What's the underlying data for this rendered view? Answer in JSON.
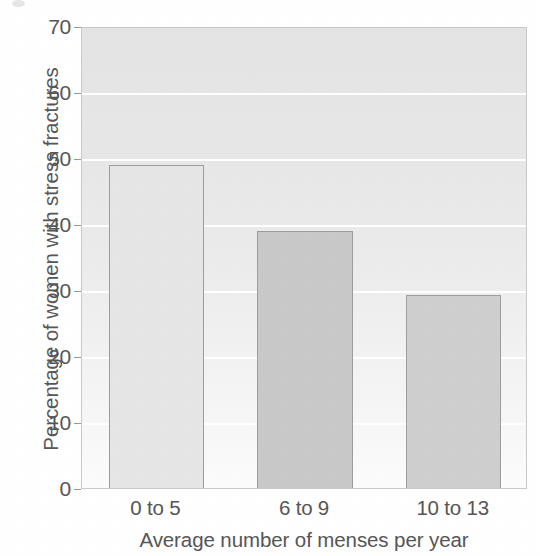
{
  "chart_data": {
    "type": "bar",
    "title": "",
    "subtitle": "",
    "xlabel": "Average number of menses per year",
    "ylabel": "Percentage of women with stress fractures",
    "categories": [
      "0 to 5",
      "6 to 9",
      "10 to 13"
    ],
    "values": [
      49.3,
      39.3,
      29.5
    ],
    "series": [
      {
        "name": "Percentage of women with stress fractures",
        "values": [
          49.3,
          39.3,
          29.5
        ]
      }
    ],
    "ylim": [
      0,
      70
    ],
    "xlim": [
      0,
      3
    ],
    "ytick_labels": [
      "70",
      "60",
      "50",
      "40",
      "30",
      "20",
      "10",
      "0"
    ],
    "ytick_values": [
      70,
      60,
      50,
      40,
      30,
      20,
      10,
      0
    ],
    "ytick_step": 10,
    "grid": true,
    "grid_axis": "y",
    "grid_color": "#ffffff",
    "legend": false,
    "legend_position": "none",
    "plot_background": "#e8e8e8",
    "frame_color": "#c9c9c9",
    "bar_edge_color": "#9d9d9d",
    "bar_fill_colors": [
      "#e6e6e6",
      "#c9c9c9",
      "#cfcfcf"
    ],
    "bar_width_fraction": 0.64,
    "text_color": "#565656",
    "annotations": []
  },
  "axes": {
    "y_ticks": [
      {
        "label": "70",
        "value": 70
      },
      {
        "label": "60",
        "value": 60
      },
      {
        "label": "50",
        "value": 50
      },
      {
        "label": "40",
        "value": 40
      },
      {
        "label": "30",
        "value": 30
      },
      {
        "label": "20",
        "value": 20
      },
      {
        "label": "10",
        "value": 10
      },
      {
        "label": "0",
        "value": 0
      }
    ],
    "x_ticks": [
      {
        "label": "0 to 5"
      },
      {
        "label": "6 to 9"
      },
      {
        "label": "10 to 13"
      }
    ]
  }
}
